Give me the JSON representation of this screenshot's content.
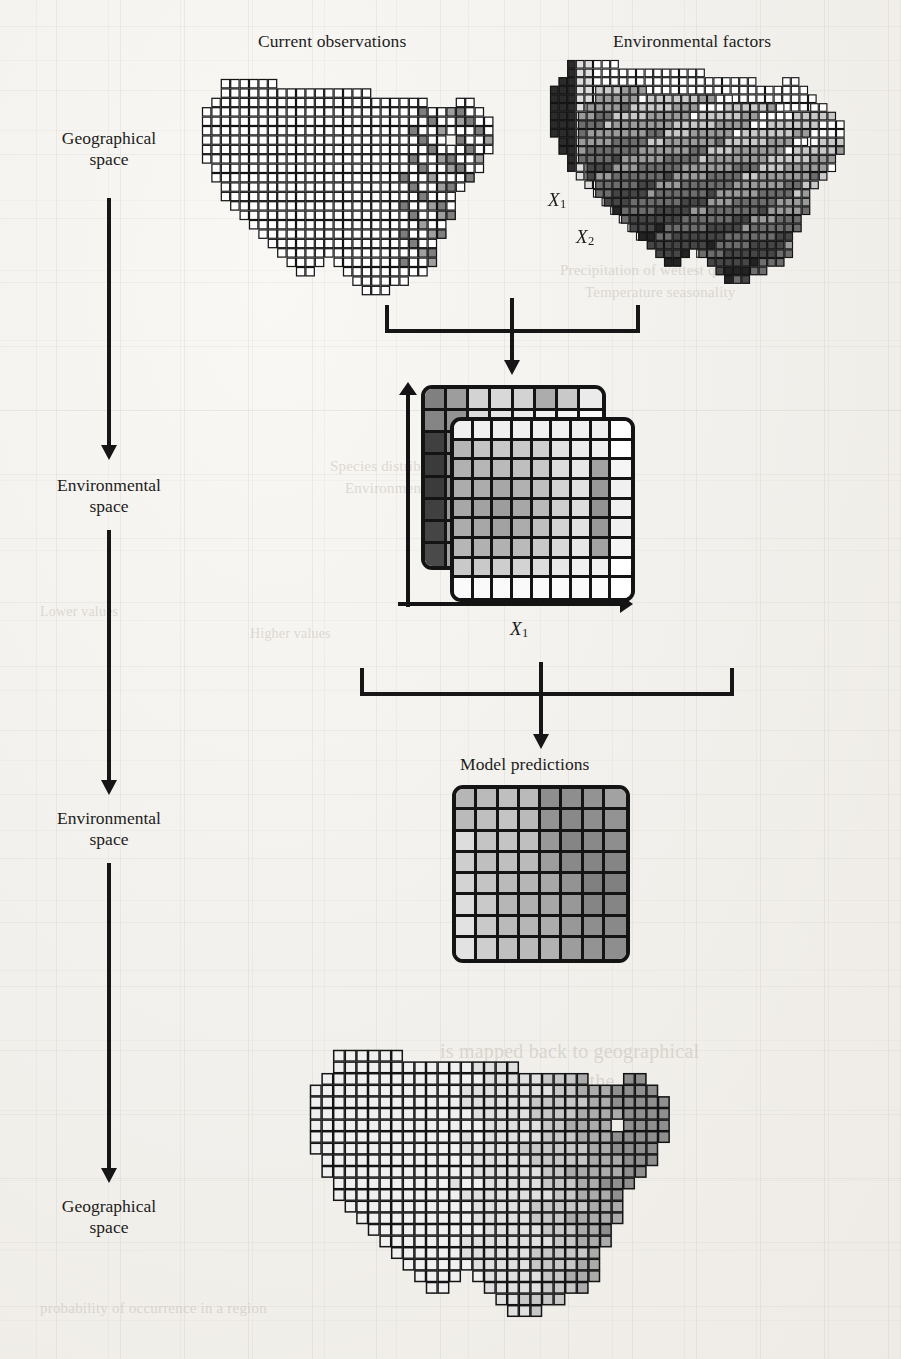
{
  "figure": {
    "type": "flow-diagram",
    "domain": "ecological-niche-modeling",
    "titles": {
      "current_observations": "Current observations",
      "environmental_factors": "Environmental factors",
      "model_predictions": "Model predictions"
    },
    "stage_labels": [
      {
        "line1": "Geographical",
        "line2": "space"
      },
      {
        "line1": "Environmental",
        "line2": "space"
      },
      {
        "line1": "Environmental",
        "line2": "space"
      },
      {
        "line1": "Geographical",
        "line2": "space"
      }
    ],
    "variable_labels": {
      "x1": "X",
      "x1_sub": "1",
      "x2": "X",
      "x2_sub": "2"
    },
    "env_space_axes": {
      "x_axis": "X",
      "x_axis_sub": "1",
      "y_axis": "X",
      "y_axis_sub": "2"
    },
    "bleed_through_text": [
      "Precipitation of wettest quarter",
      "Temperature seasonality",
      "Species distribution model",
      "Environmental values",
      "Lower values",
      "Higher values",
      "is mapped back to geographical",
      "which defines the",
      "probability of occurrence in a region"
    ],
    "colors": {
      "ink": "#161616",
      "paper": "#f2f0ec",
      "grid_line": "#141414",
      "shade_lightest": "#ffffff",
      "shade_light": "#e6e6e6",
      "shade_mid": "#9e9e9e",
      "shade_dark": "#4d4d4d",
      "shade_darkest": "#222222"
    }
  },
  "chart_data": {
    "type": "heatmap",
    "title": "Model predictions",
    "xlabel": "X1",
    "ylabel": "X2",
    "grid": true,
    "legend": "none",
    "note": "8x8 environmental-space grid of predicted suitability; values 0 (white/low) to 1 (dark/high)",
    "rows": 8,
    "cols": 8,
    "values": [
      [
        0.3,
        0.28,
        0.26,
        0.28,
        0.46,
        0.46,
        0.44,
        0.38
      ],
      [
        0.28,
        0.26,
        0.24,
        0.28,
        0.44,
        0.48,
        0.46,
        0.44
      ],
      [
        0.14,
        0.24,
        0.24,
        0.26,
        0.42,
        0.5,
        0.48,
        0.46
      ],
      [
        0.2,
        0.26,
        0.26,
        0.28,
        0.4,
        0.48,
        0.5,
        0.5
      ],
      [
        0.18,
        0.24,
        0.28,
        0.3,
        0.36,
        0.44,
        0.52,
        0.52
      ],
      [
        0.14,
        0.22,
        0.3,
        0.32,
        0.36,
        0.42,
        0.5,
        0.5
      ],
      [
        0.12,
        0.22,
        0.28,
        0.3,
        0.34,
        0.42,
        0.46,
        0.48
      ],
      [
        0.12,
        0.2,
        0.26,
        0.28,
        0.32,
        0.4,
        0.44,
        0.46
      ]
    ]
  },
  "env_plate_back": {
    "rows": 8,
    "cols": 8,
    "values": [
      [
        0.52,
        0.4,
        0.18,
        0.16,
        0.18,
        0.34,
        0.22,
        0.08
      ],
      [
        0.5,
        0.44,
        0.14,
        0.1,
        0.08,
        0.06,
        0.04,
        0.02
      ],
      [
        0.78,
        0.46,
        0.12,
        0.08,
        0.06,
        0.04,
        0.04,
        0.02
      ],
      [
        0.8,
        0.44,
        0.1,
        0.06,
        0.06,
        0.04,
        0.02,
        0.02
      ],
      [
        0.8,
        0.46,
        0.1,
        0.06,
        0.04,
        0.04,
        0.02,
        0.02
      ],
      [
        0.78,
        0.42,
        0.1,
        0.06,
        0.04,
        0.02,
        0.02,
        0.02
      ],
      [
        0.76,
        0.4,
        0.08,
        0.06,
        0.04,
        0.02,
        0.02,
        0.02
      ],
      [
        0.74,
        0.38,
        0.08,
        0.04,
        0.04,
        0.02,
        0.02,
        0.02
      ]
    ]
  },
  "env_plate_front": {
    "rows": 9,
    "cols": 9,
    "values": [
      [
        0.06,
        0.06,
        0.06,
        0.06,
        0.06,
        0.06,
        0.06,
        0.06,
        0.0
      ],
      [
        0.3,
        0.24,
        0.22,
        0.22,
        0.2,
        0.12,
        0.08,
        0.06,
        0.0
      ],
      [
        0.32,
        0.3,
        0.28,
        0.26,
        0.22,
        0.14,
        0.1,
        0.38,
        0.04
      ],
      [
        0.34,
        0.34,
        0.36,
        0.32,
        0.26,
        0.18,
        0.12,
        0.42,
        0.06
      ],
      [
        0.36,
        0.38,
        0.4,
        0.36,
        0.28,
        0.2,
        0.14,
        0.44,
        0.06
      ],
      [
        0.34,
        0.36,
        0.38,
        0.34,
        0.26,
        0.18,
        0.12,
        0.42,
        0.06
      ],
      [
        0.3,
        0.32,
        0.32,
        0.28,
        0.22,
        0.16,
        0.1,
        0.38,
        0.04
      ],
      [
        0.22,
        0.22,
        0.2,
        0.18,
        0.14,
        0.1,
        0.06,
        0.06,
        0.0
      ],
      [
        0.02,
        0.02,
        0.02,
        0.02,
        0.02,
        0.02,
        0.02,
        0.02,
        0.0
      ]
    ]
  }
}
